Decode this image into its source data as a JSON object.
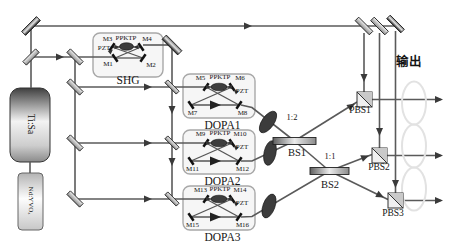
{
  "figure": {
    "output_label": "输出",
    "beam_color": "#5a5a5a"
  },
  "lasers": {
    "ti_sapphire_label": "Ti:Sa",
    "pump_laser_label": "Nd:YVO₄"
  },
  "shg": {
    "name": "SHG",
    "crystal": "PPKTP",
    "actuator": "PZT",
    "mirror_top_left": "M3",
    "mirror_top_right": "M4",
    "mirror_bottom_left": "M1",
    "mirror_bottom_right": "M2"
  },
  "dopas": [
    {
      "name": "DOPA1",
      "crystal": "PPKTP",
      "actuator": "PZT",
      "mirror_top_left": "M5",
      "mirror_top_right": "M6",
      "mirror_bottom_left": "M7",
      "mirror_bottom_right": "M8"
    },
    {
      "name": "DOPA2",
      "crystal": "PPKTP",
      "actuator": "PZT",
      "mirror_top_left": "M9",
      "mirror_top_right": "M10",
      "mirror_bottom_left": "M11",
      "mirror_bottom_right": "M12"
    },
    {
      "name": "DOPA3",
      "crystal": "PPKTP",
      "actuator": "PZT",
      "mirror_top_left": "M13",
      "mirror_top_right": "M14",
      "mirror_bottom_left": "M15",
      "mirror_bottom_right": "M16"
    }
  ],
  "beam_splitters": [
    {
      "name": "BS1",
      "ratio": "1:2"
    },
    {
      "name": "BS2",
      "ratio": "1:1"
    }
  ],
  "polarizing_beam_splitters": [
    {
      "name": "PBS1"
    },
    {
      "name": "PBS2"
    },
    {
      "name": "PBS3"
    }
  ]
}
